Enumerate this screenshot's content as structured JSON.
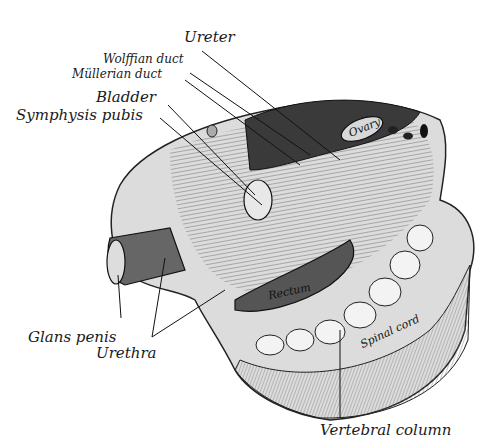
{
  "figure": {
    "type": "anatomical illustration",
    "labels": {
      "ureter": "Ureter",
      "wolffian_duct": "Wolffian duct",
      "mullerian_duct": "Müllerian duct",
      "bladder": "Bladder",
      "symphysis_pubis": "Symphysis pubis",
      "glans_penis": "Glans penis",
      "urethra": "Urethra",
      "vertebral_column": "Vertebral column",
      "rectum": "Rectum",
      "ovary": "Ovary",
      "spinal_cord": "Spinal cord"
    },
    "colors": {
      "ink": "#1a1a1a",
      "tissue_light": "#e6e6e6",
      "tissue_mid": "#9a9a9a",
      "tissue_dark": "#3a3a3a",
      "background": "#ffffff"
    }
  }
}
